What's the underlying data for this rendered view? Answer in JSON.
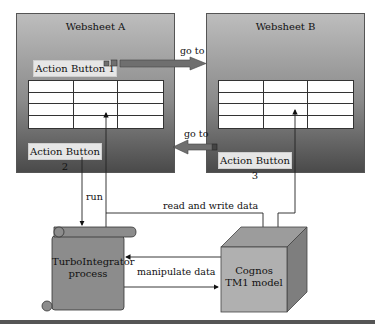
{
  "websheet_a": {
    "title": "Websheet A",
    "action_button_1": "Action Button 1",
    "action_button_2": "Action Button 2"
  },
  "websheet_b": {
    "title": "Websheet B",
    "action_button_3": "Action Button 3"
  },
  "connectors": {
    "goto_top": "go to",
    "goto_bottom": "go to",
    "run": "run",
    "read_write": "read and write data",
    "manipulate": "manipulate data"
  },
  "process": {
    "line1": "TurboIntegrator",
    "line2": "process"
  },
  "model": {
    "line1": "Cognos",
    "line2": "TM1 model"
  },
  "colors": {
    "arrow_fill": "#6f6f6f",
    "scroll_fill": "#8c8c8c",
    "cube_front": "#b0b0b0",
    "cube_top": "#9c9c9c",
    "cube_side": "#7e7e7e"
  }
}
